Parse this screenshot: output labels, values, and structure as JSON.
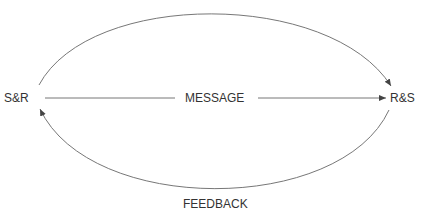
{
  "diagram": {
    "nodes": {
      "left": "S&R",
      "right": "R&S"
    },
    "edges": {
      "message": "MESSAGE",
      "feedback": "FEEDBACK"
    },
    "colors": {
      "line": "#777777",
      "text": "#333333"
    }
  }
}
